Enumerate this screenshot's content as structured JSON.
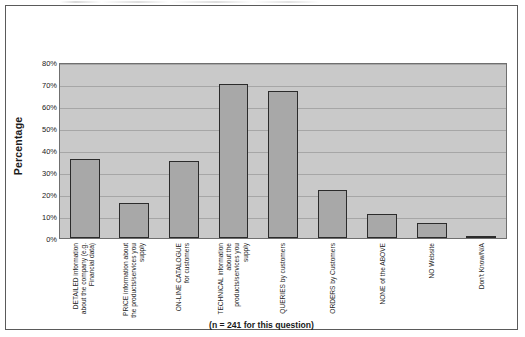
{
  "chart_data": {
    "type": "bar",
    "title": "",
    "subtitle": "",
    "xlabel": "",
    "ylabel": "Percentage",
    "caption": "(n = 241 for this question)",
    "ylim": [
      0,
      80
    ],
    "ytick_labels": [
      "80%",
      "70%",
      "60%",
      "50%",
      "40%",
      "30%",
      "20%",
      "10%",
      "0%"
    ],
    "ytick_values": [
      80,
      70,
      60,
      50,
      40,
      30,
      20,
      10,
      0
    ],
    "grid": true,
    "legend": "none",
    "categories": [
      "DETAILED information about the company (e.g. Financial data)",
      "PRICE information about the products/services you supply",
      "ON-LINE CATALOGUE for customers",
      "TECHNICAL information about the products/services you supply",
      "QUERIES by customers",
      "ORDERS by Customers",
      "NONE of the ABOVE",
      "NO Website",
      "Don't Know/N/A"
    ],
    "values": [
      36,
      16,
      35,
      70,
      67,
      22,
      11,
      7,
      1
    ],
    "colors": {
      "bar_fill": "#a8a8a8",
      "bar_edge": "#2b2b2b",
      "plot_background": "#c9c9c9",
      "gridline": "#a6a6a6",
      "frame_border": "#5a5a5a",
      "text": "#1f1f1f"
    }
  }
}
